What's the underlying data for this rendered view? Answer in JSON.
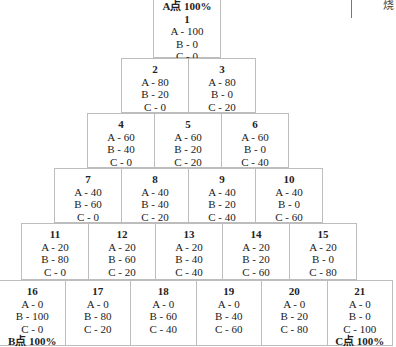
{
  "side_label": "烧",
  "cells": [
    {
      "num": "1",
      "a": "A - 100",
      "b": "B - 0",
      "c": "C - 0",
      "top_tag": "A点 100%",
      "bottom_tag": ""
    },
    {
      "num": "2",
      "a": "A - 80",
      "b": "B - 20",
      "c": "C - 0",
      "top_tag": "",
      "bottom_tag": ""
    },
    {
      "num": "3",
      "a": "A - 80",
      "b": "B - 0",
      "c": "C - 20",
      "top_tag": "",
      "bottom_tag": ""
    },
    {
      "num": "4",
      "a": "A - 60",
      "b": "B - 40",
      "c": "C - 0",
      "top_tag": "",
      "bottom_tag": ""
    },
    {
      "num": "5",
      "a": "A - 60",
      "b": "B - 20",
      "c": "C - 20",
      "top_tag": "",
      "bottom_tag": ""
    },
    {
      "num": "6",
      "a": "A - 60",
      "b": "B - 0",
      "c": "C - 40",
      "top_tag": "",
      "bottom_tag": ""
    },
    {
      "num": "7",
      "a": "A - 40",
      "b": "B - 60",
      "c": "C - 0",
      "top_tag": "",
      "bottom_tag": ""
    },
    {
      "num": "8",
      "a": "A - 40",
      "b": "B - 40",
      "c": "C - 20",
      "top_tag": "",
      "bottom_tag": ""
    },
    {
      "num": "9",
      "a": "A - 40",
      "b": "B - 20",
      "c": "C - 40",
      "top_tag": "",
      "bottom_tag": ""
    },
    {
      "num": "10",
      "a": "A - 40",
      "b": "B - 0",
      "c": "C - 60",
      "top_tag": "",
      "bottom_tag": ""
    },
    {
      "num": "11",
      "a": "A - 20",
      "b": "B - 80",
      "c": "C - 0",
      "top_tag": "",
      "bottom_tag": ""
    },
    {
      "num": "12",
      "a": "A - 20",
      "b": "B - 60",
      "c": "C - 20",
      "top_tag": "",
      "bottom_tag": ""
    },
    {
      "num": "13",
      "a": "A - 20",
      "b": "B - 40",
      "c": "C - 40",
      "top_tag": "",
      "bottom_tag": ""
    },
    {
      "num": "14",
      "a": "A - 20",
      "b": "B - 20",
      "c": "C - 60",
      "top_tag": "",
      "bottom_tag": ""
    },
    {
      "num": "15",
      "a": "A - 20",
      "b": "B - 0",
      "c": "C - 80",
      "top_tag": "",
      "bottom_tag": ""
    },
    {
      "num": "16",
      "a": "A - 0",
      "b": "B - 100",
      "c": "C - 0",
      "top_tag": "",
      "bottom_tag": "B点 100%"
    },
    {
      "num": "17",
      "a": "A - 0",
      "b": "B - 80",
      "c": "C - 20",
      "top_tag": "",
      "bottom_tag": ""
    },
    {
      "num": "18",
      "a": "A - 0",
      "b": "B - 60",
      "c": "C - 40",
      "top_tag": "",
      "bottom_tag": ""
    },
    {
      "num": "19",
      "a": "A - 0",
      "b": "B - 40",
      "c": "C - 60",
      "top_tag": "",
      "bottom_tag": ""
    },
    {
      "num": "20",
      "a": "A - 0",
      "b": "B - 20",
      "c": "C - 80",
      "top_tag": "",
      "bottom_tag": ""
    },
    {
      "num": "21",
      "a": "A - 0",
      "b": "B - 0",
      "c": "C - 100",
      "top_tag": "",
      "bottom_tag": "C点 100%"
    }
  ]
}
